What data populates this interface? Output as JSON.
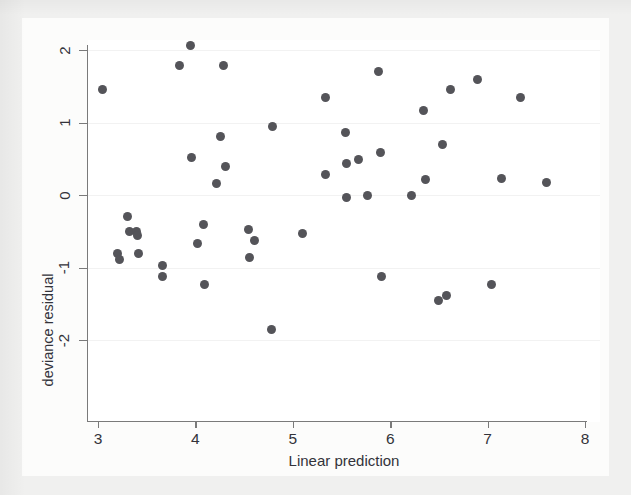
{
  "chart_data": {
    "type": "scatter",
    "title": "",
    "xlabel": "Linear prediction",
    "ylabel": "deviance residual",
    "xlim": [
      2.9,
      8.1
    ],
    "ylim": [
      -2.1,
      2.15
    ],
    "xticks": [
      "3",
      "4",
      "5",
      "6",
      "7",
      "8"
    ],
    "xtick_values": [
      3,
      4,
      5,
      6,
      7,
      8
    ],
    "yticks": [
      "2",
      "1",
      "0",
      "-1",
      "-2"
    ],
    "ytick_values": [
      2,
      1,
      0,
      -1,
      -2
    ],
    "grid": true,
    "legend": null,
    "marker": {
      "shape": "circle",
      "color": "#545459",
      "size": 9
    },
    "points": [
      {
        "x": 3.05,
        "y": 1.45
      },
      {
        "x": 3.2,
        "y": -0.8
      },
      {
        "x": 3.22,
        "y": -0.89
      },
      {
        "x": 3.3,
        "y": -0.3
      },
      {
        "x": 3.32,
        "y": -0.51
      },
      {
        "x": 3.4,
        "y": -0.51
      },
      {
        "x": 3.41,
        "y": -0.56
      },
      {
        "x": 3.42,
        "y": -0.8
      },
      {
        "x": 3.66,
        "y": -0.97
      },
      {
        "x": 3.66,
        "y": -1.13
      },
      {
        "x": 3.84,
        "y": 1.79
      },
      {
        "x": 3.95,
        "y": 2.06
      },
      {
        "x": 3.96,
        "y": 0.52
      },
      {
        "x": 4.02,
        "y": -0.67
      },
      {
        "x": 4.08,
        "y": -0.41
      },
      {
        "x": 4.09,
        "y": -1.23
      },
      {
        "x": 4.29,
        "y": 1.78
      },
      {
        "x": 4.26,
        "y": 0.81
      },
      {
        "x": 4.31,
        "y": 0.4
      },
      {
        "x": 4.22,
        "y": 0.16
      },
      {
        "x": 4.55,
        "y": -0.47
      },
      {
        "x": 4.56,
        "y": -0.86
      },
      {
        "x": 4.61,
        "y": -0.63
      },
      {
        "x": 4.79,
        "y": 0.94
      },
      {
        "x": 4.78,
        "y": -1.86
      },
      {
        "x": 5.1,
        "y": -0.53
      },
      {
        "x": 5.34,
        "y": 1.34
      },
      {
        "x": 5.34,
        "y": 0.28
      },
      {
        "x": 5.54,
        "y": 0.86
      },
      {
        "x": 5.55,
        "y": 0.43
      },
      {
        "x": 5.55,
        "y": -0.03
      },
      {
        "x": 5.67,
        "y": 0.49
      },
      {
        "x": 5.77,
        "y": -0.01
      },
      {
        "x": 5.88,
        "y": 1.7
      },
      {
        "x": 5.9,
        "y": 0.58
      },
      {
        "x": 5.91,
        "y": -1.12
      },
      {
        "x": 6.22,
        "y": -0.01
      },
      {
        "x": 6.34,
        "y": 1.17
      },
      {
        "x": 6.36,
        "y": 0.21
      },
      {
        "x": 6.54,
        "y": 0.7
      },
      {
        "x": 6.5,
        "y": -1.46
      },
      {
        "x": 6.58,
        "y": -1.39
      },
      {
        "x": 6.62,
        "y": 1.46
      },
      {
        "x": 6.9,
        "y": 1.59
      },
      {
        "x": 7.04,
        "y": -1.23
      },
      {
        "x": 7.14,
        "y": 0.23
      },
      {
        "x": 7.34,
        "y": 1.34
      },
      {
        "x": 7.6,
        "y": 0.17
      }
    ]
  },
  "axes": {
    "x_title": "Linear prediction",
    "y_title": "deviance residual"
  }
}
